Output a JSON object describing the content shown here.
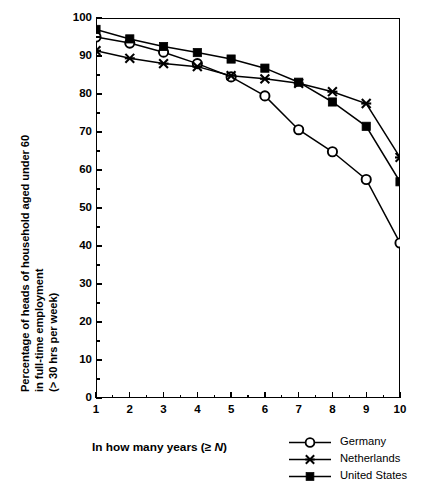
{
  "chart_data": {
    "type": "line",
    "title": "",
    "xlabel": "In how many years (≥ N)",
    "ylabel": "Percentage of heads of household aged under 60 in full-time employment (> 30 hrs per week)",
    "ylabel_lines": [
      "Percentage of heads of household aged under 60",
      "in full-time employment",
      "(> 30 hrs per week)"
    ],
    "x": [
      1,
      2,
      3,
      4,
      5,
      6,
      7,
      8,
      9,
      10
    ],
    "xlim": [
      1,
      10
    ],
    "ylim": [
      0,
      100
    ],
    "grid": false,
    "legend_position": "bottom-right",
    "yticks": [
      0,
      10,
      20,
      30,
      40,
      50,
      60,
      70,
      80,
      90,
      100
    ],
    "ytick_labels": [
      "0",
      "10",
      "20",
      "30",
      "40",
      "50",
      "60",
      "70",
      "80",
      "90",
      "100"
    ],
    "xticks": [
      1,
      2,
      3,
      4,
      5,
      6,
      7,
      8,
      9,
      10
    ],
    "xtick_labels": [
      "1",
      "2",
      "3",
      "4",
      "5",
      "6",
      "7",
      "8",
      "9",
      "10"
    ],
    "series": [
      {
        "name": "Germany",
        "marker": "open-circle",
        "values": [
          95.0,
          93.4,
          91.0,
          88.0,
          84.5,
          79.5,
          70.6,
          64.8,
          57.5,
          40.8
        ]
      },
      {
        "name": "Netherlands",
        "marker": "cross",
        "values": [
          91.4,
          89.4,
          88.0,
          87.2,
          84.8,
          84.0,
          82.8,
          80.6,
          77.5,
          63.3
        ]
      },
      {
        "name": "United States",
        "marker": "filled-square",
        "values": [
          97.0,
          94.5,
          92.5,
          90.9,
          89.2,
          86.8,
          83.1,
          77.9,
          71.5,
          56.9
        ]
      }
    ]
  },
  "legend": {
    "items": [
      {
        "label": "Germany",
        "marker": "open-circle"
      },
      {
        "label": "Netherlands",
        "marker": "cross"
      },
      {
        "label": "United States",
        "marker": "filled-square"
      }
    ]
  },
  "colors": {
    "line": "#000000",
    "background": "#ffffff",
    "axis": "#000000"
  }
}
